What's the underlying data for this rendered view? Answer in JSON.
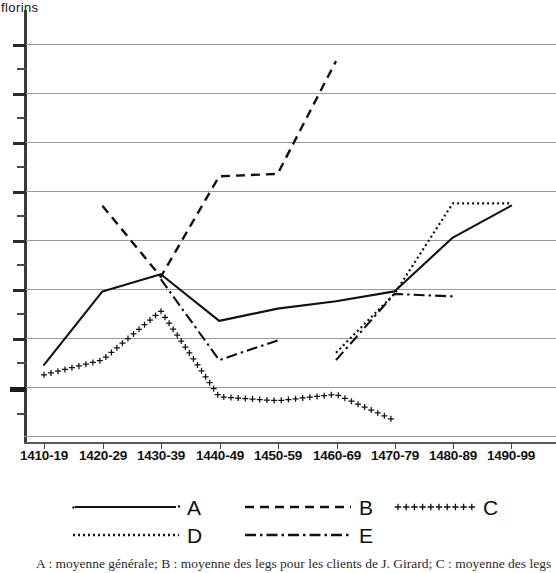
{
  "axis": {
    "ylabel": "florins",
    "ylabel_truncated": true,
    "xtick_labels": [
      "1410-19",
      "1420-29",
      "1430-39",
      "1440-49",
      "1450-59",
      "1460-69",
      "1470-79",
      "1480-89",
      "1490-99"
    ]
  },
  "legend": {
    "items": [
      {
        "key": "A",
        "label": "A",
        "style": "solid"
      },
      {
        "key": "B",
        "label": "B",
        "style": "dashed"
      },
      {
        "key": "C",
        "label": "C",
        "style": "plus-markers"
      },
      {
        "key": "D",
        "label": "D",
        "style": "dotted"
      },
      {
        "key": "E",
        "label": "E",
        "style": "dash-dot"
      }
    ]
  },
  "caption": {
    "text": "A : moyenne générale; B : moyenne des legs pour les clients de J. Girard; C : moyenne des legs"
  },
  "chart_data": {
    "type": "line",
    "title": "",
    "xlabel": "",
    "ylabel": "florins",
    "grid": true,
    "legend_position": "bottom",
    "categories": [
      "1410-19",
      "1420-29",
      "1430-39",
      "1440-49",
      "1450-59",
      "1460-69",
      "1470-79",
      "1480-89",
      "1490-99"
    ],
    "note": "Y axis numeric tick labels are cropped off the left edge of the image; values below are read in relative gridline units where each major gridline is one unit apart (top gridline = 8, bottom gridline = 0).",
    "yaxis": {
      "gridline_count": 9,
      "labels_visible": false,
      "minor_ticks": true
    },
    "series": [
      {
        "name": "A",
        "label": "moyenne générale",
        "style": "solid",
        "x": [
          "1410-19",
          "1420-29",
          "1430-39",
          "1440-49",
          "1450-59",
          "1460-69",
          "1470-79",
          "1480-89",
          "1490-99"
        ],
        "values": [
          1.45,
          2.95,
          3.3,
          2.35,
          2.6,
          2.75,
          2.95,
          4.05,
          4.7
        ]
      },
      {
        "name": "B",
        "label": "moyenne des legs pour les clients de J. Girard",
        "style": "dashed",
        "x": [
          "1420-29",
          "1430-39",
          "1440-49",
          "1450-59",
          "1460-69"
        ],
        "values": [
          4.7,
          3.25,
          5.3,
          5.35,
          7.65
        ]
      },
      {
        "name": "C",
        "label": "moyenne des legs",
        "style": "plus-markers",
        "x": [
          "1410-19",
          "1420-29",
          "1430-39",
          "1440-49",
          "1450-59",
          "1460-69",
          "1470-79"
        ],
        "values": [
          1.25,
          1.55,
          2.55,
          0.8,
          0.72,
          0.85,
          0.32
        ]
      },
      {
        "name": "D",
        "style": "dotted",
        "x": [
          "1460-69",
          "1470-79",
          "1480-89",
          "1490-99"
        ],
        "values": [
          1.7,
          2.9,
          4.75,
          4.75
        ]
      },
      {
        "name": "E",
        "style": "dash-dot",
        "x": [
          "1430-39",
          "1440-49",
          "1450-59"
        ],
        "values": [
          3.2,
          1.55,
          1.95
        ]
      },
      {
        "name": "E2",
        "style": "dash-dot",
        "x": [
          "1460-69",
          "1470-79",
          "1480-89"
        ],
        "values": [
          1.55,
          2.9,
          2.85
        ]
      }
    ]
  }
}
